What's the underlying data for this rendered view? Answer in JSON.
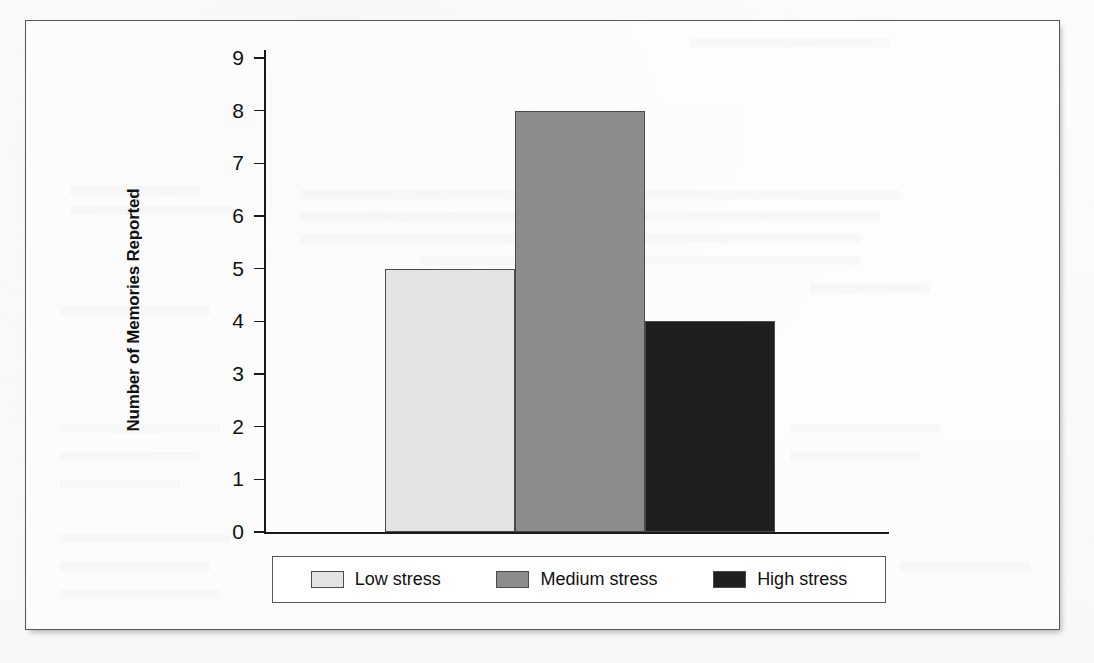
{
  "figure": {
    "frame_border_color": "#54565c",
    "background_color": "#ffffff"
  },
  "chart_data": {
    "type": "bar",
    "title": "",
    "xlabel": "",
    "ylabel": "Number of Memories Reported",
    "categories": [
      "Low stress",
      "Medium stress",
      "High stress"
    ],
    "values": [
      5,
      8,
      4
    ],
    "colors": [
      "#e3e3e3",
      "#8c8c8c",
      "#1f1f1f"
    ],
    "bar_edge_color": "#4a4a4a",
    "ylim": [
      0,
      9
    ],
    "ytick_labels": [
      "9",
      "8",
      "7",
      "6",
      "5",
      "4",
      "3",
      "2",
      "1",
      "0"
    ],
    "ytick_values": [
      9,
      8,
      7,
      6,
      5,
      4,
      3,
      2,
      1,
      0
    ],
    "xtick_labels": [],
    "grid": false,
    "legend_position": "bottom",
    "legend": [
      {
        "label": "Low stress",
        "color": "#e3e3e3"
      },
      {
        "label": "Medium stress",
        "color": "#8c8c8c"
      },
      {
        "label": "High stress",
        "color": "#1f1f1f"
      }
    ]
  }
}
